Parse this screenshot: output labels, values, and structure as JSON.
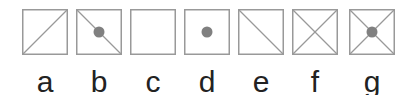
{
  "colors": {
    "stroke": "#999999",
    "dot": "#808080",
    "text": "#222222"
  },
  "items": [
    {
      "label": "a",
      "diag_up": true,
      "diag_down": false,
      "dot": false
    },
    {
      "label": "b",
      "diag_up": false,
      "diag_down": true,
      "dot": true
    },
    {
      "label": "c",
      "diag_up": false,
      "diag_down": false,
      "dot": false
    },
    {
      "label": "d",
      "diag_up": false,
      "diag_down": false,
      "dot": true
    },
    {
      "label": "e",
      "diag_up": false,
      "diag_down": true,
      "dot": false
    },
    {
      "label": "f",
      "diag_up": true,
      "diag_down": true,
      "dot": false
    },
    {
      "label": "g",
      "diag_up": true,
      "diag_down": true,
      "dot": true
    }
  ]
}
